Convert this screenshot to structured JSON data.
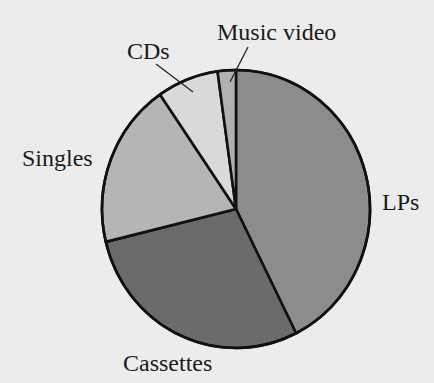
{
  "chart_data": {
    "type": "pie",
    "title": "",
    "categories": [
      "LPs",
      "Cassettes",
      "Singles",
      "CDs",
      "Music video"
    ],
    "values": [
      42.6,
      28.6,
      19.2,
      7.4,
      2.2
    ],
    "unit": "percent (estimated from slice angles)",
    "start_angle_deg": 0,
    "direction": "clockwise",
    "colors": [
      "#8c8c8c",
      "#6b6b6b",
      "#b5b5b5",
      "#d9d9d9",
      "#b0b0b0"
    ],
    "labels": [
      {
        "text": "LPs",
        "x": 382,
        "y": 210,
        "anchor": "start",
        "leader": null
      },
      {
        "text": "Cassettes",
        "x": 123,
        "y": 371,
        "anchor": "start",
        "leader": null
      },
      {
        "text": "Singles",
        "x": 22,
        "y": 166,
        "anchor": "start",
        "leader": null
      },
      {
        "text": "CDs",
        "x": 127,
        "y": 59,
        "anchor": "start",
        "leader": [
          156,
          64,
          193,
          92
        ]
      },
      {
        "text": "Music video",
        "x": 217,
        "y": 40,
        "anchor": "start",
        "leader": [
          248,
          47,
          230,
          82
        ]
      }
    ],
    "legend": "none (direct labels)",
    "grid": false
  },
  "layout": {
    "center": [
      236,
      209
    ],
    "rx": 134,
    "ry": 139,
    "background": "#ececec"
  }
}
